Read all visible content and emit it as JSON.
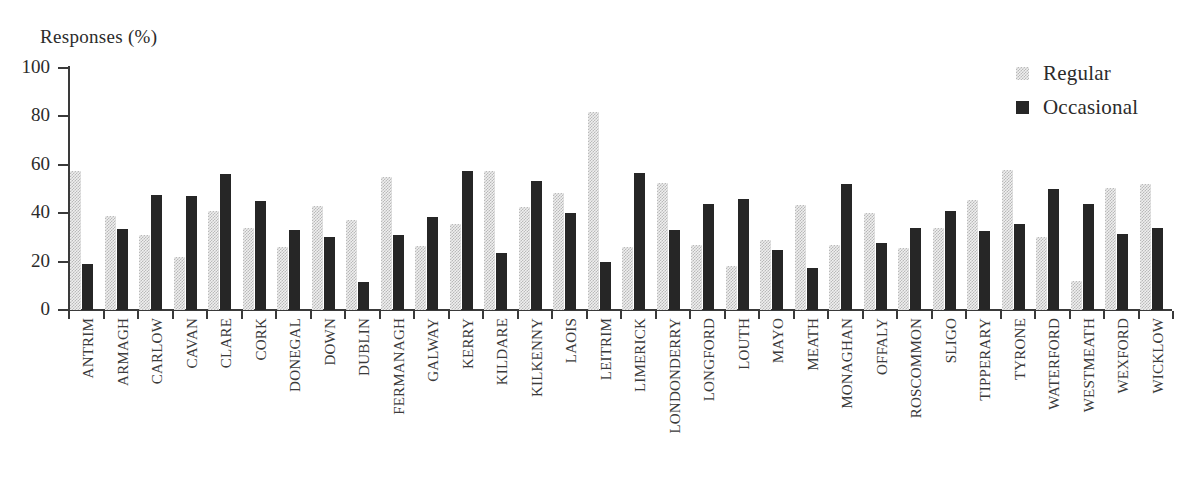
{
  "chart_data": {
    "type": "bar",
    "title": "",
    "xlabel": "",
    "ylabel": "Responses (%)",
    "ylim": [
      0,
      100
    ],
    "yticks": [
      0,
      20,
      40,
      60,
      80,
      100
    ],
    "ytick_labels": [
      "0",
      "20",
      "40",
      "60",
      "80",
      "100"
    ],
    "grid": false,
    "legend_position": "top-right",
    "categories": [
      "ANTRIM",
      "ARMAGH",
      "CARLOW",
      "CAVAN",
      "CLARE",
      "CORK",
      "DONEGAL",
      "DOWN",
      "DUBLIN",
      "FERMANAGH",
      "GALWAY",
      "KERRY",
      "KILDARE",
      "KILKENNY",
      "LAOIS",
      "LEITRIM",
      "LIMERICK",
      "LONDONDERRY",
      "LONGFORD",
      "LOUTH",
      "MAYO",
      "MEATH",
      "MONAGHAN",
      "OFFALY",
      "ROSCOMMON",
      "SLIGO",
      "TIPPERARY",
      "TYRONE",
      "WATERFORD",
      "WESTMEATH",
      "WEXFORD",
      "WICKLOW"
    ],
    "series": [
      {
        "name": "Regular",
        "color": "#d8d8d8",
        "values": [
          57.5,
          39,
          31,
          22,
          41,
          34,
          26,
          43,
          37,
          55,
          26.5,
          35.5,
          57.5,
          42.5,
          48.5,
          82,
          26,
          52.5,
          27,
          18,
          29,
          43.5,
          27,
          40,
          25.5,
          34,
          45.5,
          58,
          30,
          12,
          50.5,
          52
        ]
      },
      {
        "name": "Occasional",
        "color": "#262626",
        "values": [
          19,
          33.5,
          47.5,
          47,
          56,
          45,
          33,
          30,
          11.5,
          31,
          38.5,
          57.5,
          23.5,
          53.5,
          40,
          20,
          56.5,
          33,
          44,
          46,
          25,
          17.5,
          52,
          27.5,
          34,
          41,
          32.5,
          35.5,
          50,
          44,
          31.5,
          34
        ]
      }
    ]
  },
  "legend": {
    "items": [
      {
        "label": "Regular",
        "swatch": "regular"
      },
      {
        "label": "Occasional",
        "swatch": "occasional"
      }
    ]
  }
}
